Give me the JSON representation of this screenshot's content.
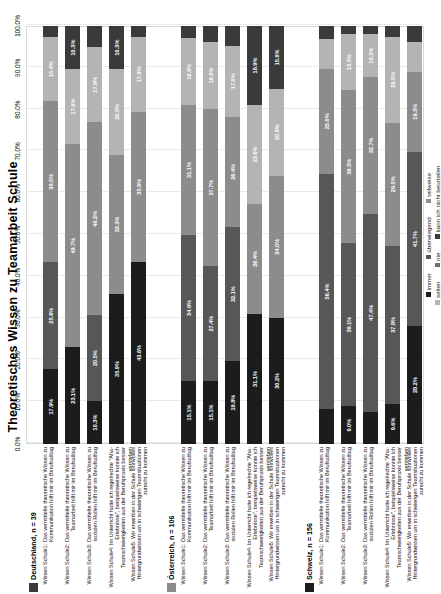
{
  "chart": {
    "title": "Theoretisches Wissen zu Teamarbeit Schule",
    "xlabel": "",
    "ylabel": ""
  },
  "axis": {
    "ticks": [
      "0.0%",
      "10.0%",
      "20.0%",
      "30.0%",
      "40.0%",
      "50.0%",
      "60.0%",
      "70.0%",
      "80.0%",
      "90.0%",
      "100.0%"
    ]
  },
  "legend": {
    "row1": [
      {
        "label": "immer",
        "color": "#1c1c1c"
      },
      {
        "label": "überwiegend",
        "color": "#575757"
      },
      {
        "label": "teilweise",
        "color": "#8c8c8c"
      }
    ],
    "row2": [
      {
        "label": "selten",
        "color": "#b4b4b4"
      },
      {
        "label": "nie",
        "color": "#6e6e6e"
      },
      {
        "label": "kann ich nicht beurteilen",
        "color": "#3a3a3a"
      }
    ]
  },
  "groups": [
    {
      "name": "Deutschland, n = 39",
      "swatch": "#3a3a3a",
      "rows": [
        {
          "label": "Wissen Schule1: Das vermittelte theoretische Wissen zu Kommunikation hilft mir im Berufsalltag",
          "values": [
            "17.9%",
            "25.6%",
            "38.5%",
            "15.4%",
            "2.6%"
          ]
        },
        {
          "label": "Wissen Schule2: Das vermittelte theoretische Wissen zu Teamarbeit hilft mir im Berufsalltag",
          "values": [
            "23.1%",
            "",
            "48.7%",
            "17.9%",
            "10.3%"
          ]
        },
        {
          "label": "Wissen Schule3: Das vermittelte theoretische Wissen zu sozialen Rollen hilft mir im Berufsalltag",
          "values": [
            "10.3%",
            "20.5%",
            "46.2%",
            "17.9%",
            "5.1%"
          ]
        },
        {
          "label": "Wissen Schule4: Im Unterricht hatte ich regelrechte \"Aha-Erlebnisse\", beispielsweise konnte ich Teamschwierigkeiten aus der Berufspraxis besser verstehen",
          "values": [
            "35.9%",
            "",
            "33.3%",
            "20.5%",
            "10.3%"
          ]
        },
        {
          "label": "Wissen Schule5: Wir erwerben in der Schule sinnvolles Hintergrundwissen um in schwierigen Teamsituationen zurecht zu kommen",
          "values": [
            "43.6%",
            "",
            "35.9%",
            "17.9%",
            "2.6%"
          ]
        }
      ]
    },
    {
      "name": "Österreich, n = 106",
      "swatch": "#8c8c8c",
      "rows": [
        {
          "label": "Wissen Schule1: Das vermittelte theoretische Wissen zu Kommunikation hilft mir im Berufsalltag",
          "values": [
            "15.1%",
            "34.9%",
            "31.1%",
            "16.0%",
            "2.9%"
          ]
        },
        {
          "label": "Wissen Schule2: Das vermittelte theoretische Wissen zu Teamarbeit hilft mir im Berufsalltag",
          "values": [
            "15.1%",
            "27.4%",
            "37.7%",
            "16.0%",
            "3.8%"
          ]
        },
        {
          "label": "Wissen Schule3: Das vermittelte theoretische Wissen zu sozialen Rollen hilft mir im Berufsalltag",
          "values": [
            "19.8%",
            "32.1%",
            "26.4%",
            "17.0%",
            "4.7%"
          ]
        },
        {
          "label": "Wissen Schule4: Im Unterricht hatte ich regelrechte \"Aha-Erlebnisse\", beispielsweise konnte ich Teamschwierigkeiten aus der Berufspraxis besser verstehen",
          "values": [
            "31.1%",
            "",
            "26.4%",
            "23.6%",
            "18.9%"
          ]
        },
        {
          "label": "Wissen Schule5: Wir erwerben in der Schule sinnvolles Hintergrundwissen um in schwierigen Teamsituationen zurecht zu kommen",
          "values": [
            "30.2%",
            "",
            "34.0%",
            "20.8%",
            "15.0%"
          ]
        }
      ]
    },
    {
      "name": "Schweiz, n = 156",
      "swatch": "#1c1c1c",
      "rows": [
        {
          "label": "Wissen Schule1: Das vermittelte theoretische Wissen zu Kommunikation hilft mir im Berufsalltag",
          "values": [
            "8.3%",
            "56.4%",
            "25.0%",
            "7.1%",
            "3.2%"
          ]
        },
        {
          "label": "Wissen Schule2: Das vermittelte theoretische Wissen zu Teamarbeit hilft mir im Berufsalltag",
          "values": [
            "9.0%",
            "39.1%",
            "36.5%",
            "13.5%",
            "1.9%"
          ]
        },
        {
          "label": "Wissen Schule3: Das vermittelte theoretische Wissen zu sozialen Rollen hilft mir im Berufsalltag",
          "values": [
            "7.7%",
            "47.4%",
            "32.7%",
            "10.3%",
            "1.9%"
          ]
        },
        {
          "label": "Wissen Schule4: Im Unterricht hatte ich regelrechte \"Aha-Erlebnisse\", beispielsweise konnte ich Teamschwierigkeiten aus der Berufspraxis besser verstehen",
          "values": [
            "9.6%",
            "37.8%",
            "29.5%",
            "20.5%",
            "2.6%"
          ]
        },
        {
          "label": "Wissen Schule5: Wir erwerben in der Schule sinnvolles Hintergrundwissen um in schwierigen Teamsituationen zurecht zu kommen",
          "values": [
            "28.2%",
            "41.7%",
            "19.2%",
            "7.1%",
            "3.8%"
          ]
        }
      ]
    }
  ],
  "chart_data": {
    "type": "bar",
    "subtype": "100% stacked horizontal",
    "title": "Theoretisches Wissen zu Teamarbeit Schule",
    "xlabel": "",
    "ylabel": "",
    "xlim": [
      0,
      100
    ],
    "xticks": [
      0,
      10,
      20,
      30,
      40,
      50,
      60,
      70,
      80,
      90,
      100
    ],
    "xtick_labels": [
      "0.0%",
      "10.0%",
      "20.0%",
      "30.0%",
      "40.0%",
      "50.0%",
      "60.0%",
      "70.0%",
      "80.0%",
      "90.0%",
      "100.0%"
    ],
    "grid": true,
    "legend_position": "bottom",
    "legend_entries": [
      "immer",
      "überwiegend",
      "teilweise",
      "selten",
      "nie",
      "kann ich nicht beurteilen"
    ],
    "series": [
      {
        "name": "immer",
        "color": "#1c1c1c",
        "values": [
          17.9,
          23.1,
          10.3,
          35.9,
          43.6,
          15.1,
          15.1,
          19.8,
          31.1,
          30.2,
          8.3,
          9.0,
          7.7,
          9.6,
          28.2
        ]
      },
      {
        "name": "überwiegend",
        "color": "#575757",
        "values": [
          25.6,
          0.0,
          20.5,
          0.0,
          0.0,
          34.9,
          27.4,
          32.1,
          0.0,
          0.0,
          56.4,
          39.1,
          47.4,
          37.8,
          41.7
        ]
      },
      {
        "name": "teilweise",
        "color": "#8c8c8c",
        "values": [
          38.5,
          48.7,
          46.2,
          33.3,
          35.9,
          31.1,
          37.7,
          26.4,
          26.4,
          34.0,
          25.0,
          36.5,
          32.7,
          29.5,
          19.2
        ]
      },
      {
        "name": "selten",
        "color": "#b4b4b4",
        "values": [
          15.4,
          17.9,
          17.9,
          20.5,
          17.9,
          16.0,
          16.0,
          17.0,
          23.6,
          20.8,
          7.1,
          13.5,
          10.3,
          20.5,
          7.1
        ]
      },
      {
        "name": "nie / kann ich nicht beurteilen",
        "color": "#3a3a3a",
        "values": [
          2.6,
          10.3,
          5.1,
          10.3,
          2.6,
          2.9,
          3.8,
          4.7,
          18.9,
          15.0,
          3.2,
          1.9,
          1.9,
          2.6,
          3.8
        ]
      }
    ],
    "categories": [
      "Deutschland, n = 39 | Wissen Schule1",
      "Deutschland, n = 39 | Wissen Schule2",
      "Deutschland, n = 39 | Wissen Schule3",
      "Deutschland, n = 39 | Wissen Schule4",
      "Deutschland, n = 39 | Wissen Schule5",
      "Österreich, n = 106 | Wissen Schule1",
      "Österreich, n = 106 | Wissen Schule2",
      "Österreich, n = 106 | Wissen Schule3",
      "Österreich, n = 106 | Wissen Schule4",
      "Österreich, n = 106 | Wissen Schule5",
      "Schweiz, n = 156 | Wissen Schule1",
      "Schweiz, n = 156 | Wissen Schule2",
      "Schweiz, n = 156 | Wissen Schule3",
      "Schweiz, n = 156 | Wissen Schule4",
      "Schweiz, n = 156 | Wissen Schule5"
    ]
  }
}
